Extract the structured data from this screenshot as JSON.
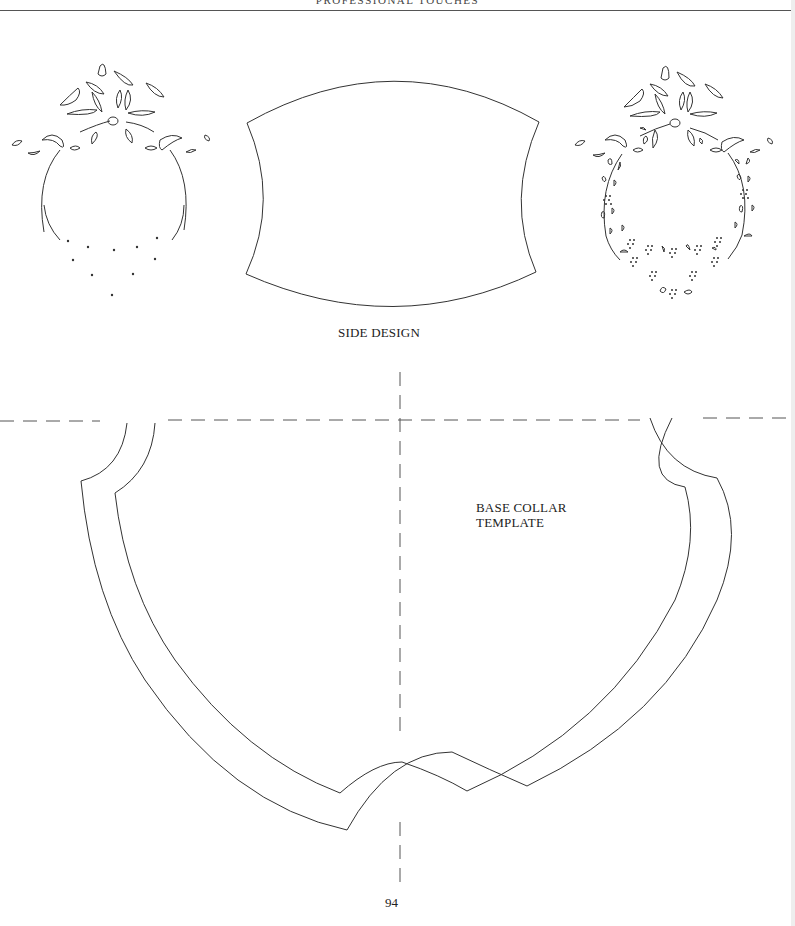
{
  "page": {
    "running_header": "PROFESSIONAL TOUCHES",
    "page_number": "94"
  },
  "figures": {
    "side_design": {
      "label": "SIDE DESIGN"
    },
    "base_collar_template": {
      "label": "BASE COLLAR TEMPLATE"
    },
    "left_motif": {
      "name": "floral-ring-outline"
    },
    "right_motif": {
      "name": "floral-ring-embroidered"
    }
  },
  "colors": {
    "line": "#333333",
    "dash": "#555555",
    "paper": "#ffffff"
  }
}
